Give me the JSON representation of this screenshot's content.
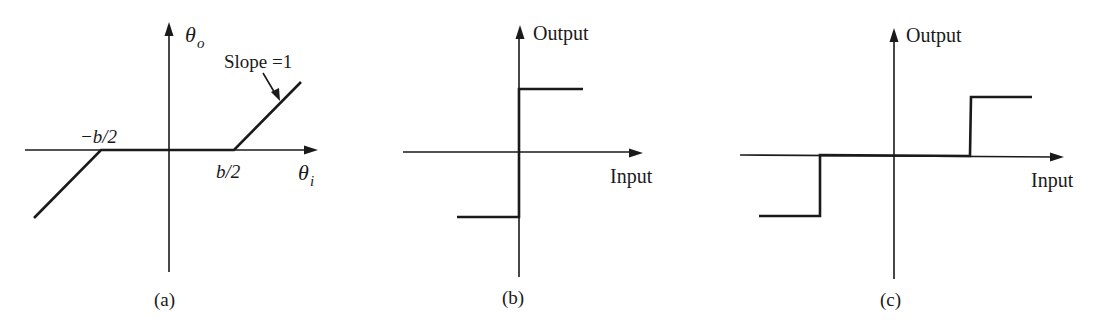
{
  "colors": {
    "ink": "#1a1a1a",
    "background": "#ffffff"
  },
  "panels": [
    {
      "id": "a",
      "caption": "(a)",
      "y_axis_label": "θ",
      "y_axis_sub": "o",
      "x_axis_label": "θ",
      "x_axis_sub": "i",
      "tick_labels": [
        "−b/2",
        "b/2"
      ],
      "annotation": "Slope =1",
      "description": "Dead-zone characteristic: zero output between −b/2 and b/2, slope 1 outside"
    },
    {
      "id": "b",
      "caption": "(b)",
      "y_axis_label": "Output",
      "x_axis_label": "Input",
      "description": "Ideal relay (sign) characteristic"
    },
    {
      "id": "c",
      "caption": "(c)",
      "y_axis_label": "Output",
      "x_axis_label": "Input",
      "description": "Relay with dead zone characteristic"
    }
  ]
}
